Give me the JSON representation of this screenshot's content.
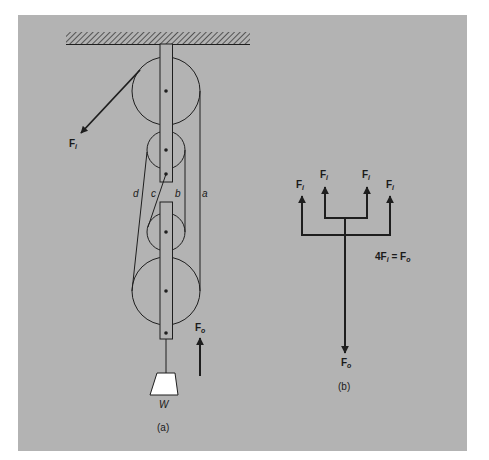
{
  "figure": {
    "background": "#b3b3b3",
    "line_color": "#1e1e1e",
    "weight_fill": "#ffffff",
    "part_a": {
      "caption": "(a)",
      "input_force": {
        "symbol": "F",
        "subscript": "i"
      },
      "output_force": {
        "symbol": "F",
        "subscript": "o"
      },
      "weight_label": "W",
      "rope_labels": [
        "a",
        "b",
        "c",
        "d"
      ]
    },
    "part_b": {
      "caption": "(b)",
      "input_forces": [
        {
          "symbol": "F",
          "subscript": "i"
        },
        {
          "symbol": "F",
          "subscript": "i"
        },
        {
          "symbol": "F",
          "subscript": "i"
        },
        {
          "symbol": "F",
          "subscript": "i"
        }
      ],
      "output_force": {
        "symbol": "F",
        "subscript": "o"
      },
      "equation": {
        "coef": "4",
        "lhs_symbol": "F",
        "lhs_sub": "i",
        "eq": " = ",
        "rhs_symbol": "F",
        "rhs_sub": "o"
      }
    }
  }
}
